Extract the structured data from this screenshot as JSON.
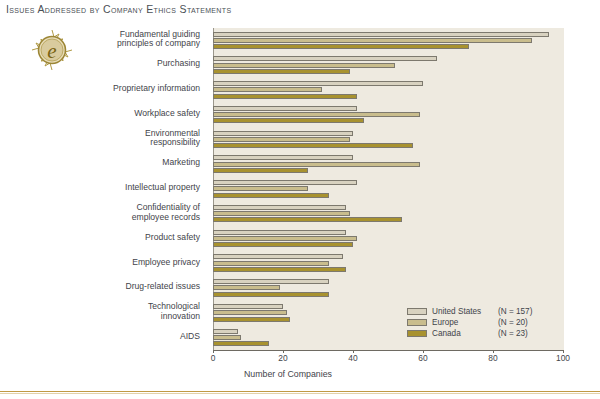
{
  "title": "Issues Addressed by Company Ethics Statements",
  "logo": {
    "name": "ethics-e-medallion",
    "letter": "e"
  },
  "chart_data": {
    "type": "bar",
    "orientation": "horizontal",
    "title": "Issues Addressed by Company Ethics Statements",
    "xlabel": "Number of Companies",
    "ylabel": "",
    "xlim": [
      0,
      100
    ],
    "xticks": [
      0,
      20,
      40,
      60,
      80,
      100
    ],
    "grid": false,
    "legend_position": "bottom-right",
    "categories": [
      "Fundamental guiding principles of company",
      "Purchasing",
      "Proprietary information",
      "Workplace safety",
      "Environmental responsibility",
      "Marketing",
      "Intellectual property",
      "Confidentiality of employee records",
      "Product safety",
      "Employee privacy",
      "Drug-related issues",
      "Technological innovation",
      "AIDS"
    ],
    "series": [
      {
        "name": "United States",
        "n_label": "(N = 157)",
        "color": "#d8d2c0",
        "values": [
          96,
          64,
          60,
          41,
          40,
          40,
          41,
          38,
          38,
          37,
          33,
          20,
          7
        ]
      },
      {
        "name": "Europe",
        "n_label": "(N = 20)",
        "color": "#c9bd8d",
        "values": [
          91,
          52,
          31,
          59,
          39,
          59,
          27,
          39,
          41,
          33,
          19,
          21,
          8
        ]
      },
      {
        "name": "Canada",
        "n_label": "(N = 23)",
        "color": "#a8922f",
        "values": [
          73,
          39,
          41,
          43,
          57,
          27,
          33,
          54,
          40,
          38,
          33,
          22,
          16
        ]
      }
    ]
  },
  "category_lines": [
    [
      "Fundamental guiding",
      "principles of company"
    ],
    [
      "Purchasing"
    ],
    [
      "Proprietary information"
    ],
    [
      "Workplace safety"
    ],
    [
      "Environmental",
      "responsibility"
    ],
    [
      "Marketing"
    ],
    [
      "Intellectual property"
    ],
    [
      "Confidentiality of",
      "employee records"
    ],
    [
      "Product safety"
    ],
    [
      "Employee privacy"
    ],
    [
      "Drug-related issues"
    ],
    [
      "Technological",
      "innovation"
    ],
    [
      "AIDS"
    ]
  ],
  "xticks_text": [
    "0",
    "20",
    "40",
    "60",
    "80",
    "100"
  ],
  "xlabel_text": "Number of Companies",
  "colors": {
    "plot_background": "#eeeae0",
    "page_background": "#ffffff",
    "united_states": "#d8d2c0",
    "europe": "#c9bd8d",
    "canada": "#a8922f",
    "axis": "#6e6a62",
    "text": "#3f444a",
    "rule": "#c09a44"
  }
}
